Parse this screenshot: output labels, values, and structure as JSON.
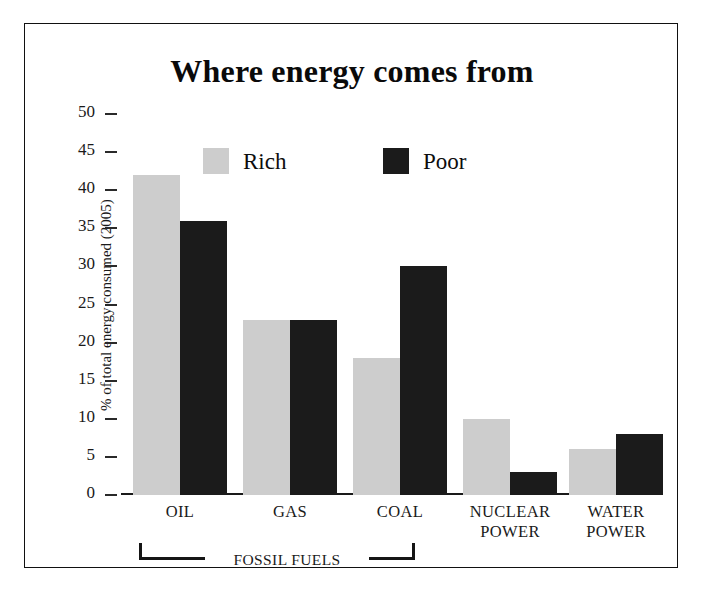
{
  "chart_data": {
    "type": "bar",
    "title": "Where energy comes from",
    "xlabel": "",
    "ylabel": "% of total energy consumed (2005)",
    "ylim": [
      0,
      50
    ],
    "yticks": [
      0,
      5,
      10,
      15,
      20,
      25,
      30,
      35,
      40,
      45,
      50
    ],
    "grid": false,
    "legend_position": "top-center",
    "categories": [
      "OIL",
      "GAS",
      "COAL",
      "NUCLEAR POWER",
      "WATER POWER"
    ],
    "category_lines": [
      [
        "OIL"
      ],
      [
        "GAS"
      ],
      [
        "COAL"
      ],
      [
        "NUCLEAR",
        "POWER"
      ],
      [
        "WATER",
        "POWER"
      ]
    ],
    "series": [
      {
        "name": "Rich",
        "color": "#cdcdcd",
        "values": [
          42,
          23,
          18,
          10,
          6
        ]
      },
      {
        "name": "Poor",
        "color": "#1b1b1b",
        "values": [
          36,
          23,
          30,
          3,
          8
        ]
      }
    ],
    "annotations": [
      {
        "name": "fossil-fuels-bracket",
        "text": "FOSSIL FUELS",
        "spans": [
          "OIL",
          "GAS",
          "COAL"
        ]
      }
    ]
  },
  "legend": {
    "rich_label": "Rich",
    "poor_label": "Poor"
  },
  "axis": {
    "y_title": "% of total energy consumed (2005)",
    "tick_0": "0",
    "tick_5": "5",
    "tick_10": "10",
    "tick_15": "15",
    "tick_20": "20",
    "tick_25": "25",
    "tick_30": "30",
    "tick_35": "35",
    "tick_40": "40",
    "tick_45": "45",
    "tick_50": "50"
  },
  "xlabels": {
    "oil": "OIL",
    "gas": "GAS",
    "coal": "COAL",
    "nuclear_1": "NUCLEAR",
    "nuclear_2": "POWER",
    "water_1": "WATER",
    "water_2": "POWER"
  },
  "bracket": {
    "label": "FOSSIL FUELS"
  }
}
